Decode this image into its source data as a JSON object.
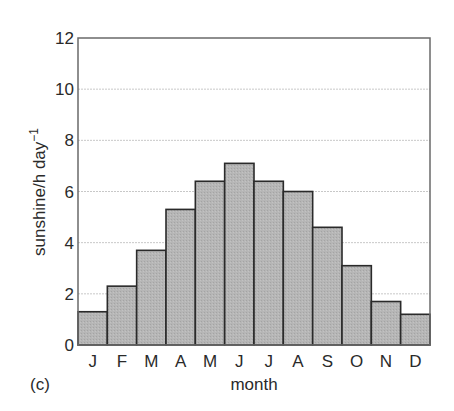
{
  "chart_data": {
    "type": "bar",
    "title": "",
    "panel_label": "(c)",
    "xlabel": "month",
    "ylabel": "sunshine/h day",
    "ylabel_superscript": "−1",
    "categories": [
      "J",
      "F",
      "M",
      "A",
      "M",
      "J",
      "J",
      "A",
      "S",
      "O",
      "N",
      "D"
    ],
    "values": [
      1.3,
      2.3,
      3.7,
      5.3,
      6.4,
      7.1,
      6.4,
      6.0,
      4.6,
      3.1,
      1.7,
      1.2
    ],
    "ylim": [
      0,
      12
    ],
    "yticks": [
      0,
      2,
      4,
      6,
      8,
      10,
      12
    ],
    "grid": true,
    "legend": null,
    "colors": {
      "bar_fill": "#b4b4b4",
      "bar_edge": "#2a2a2a",
      "grid": "#c8c8c8",
      "axis": "#6a6a6a"
    }
  }
}
